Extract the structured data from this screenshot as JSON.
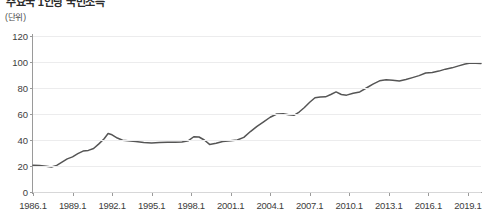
{
  "header": {
    "title": "주요국 1인당 국민소득",
    "bullet_icon": "bullet-dot-icon",
    "unit_label": "(단위)"
  },
  "chart_data": {
    "type": "line",
    "title": "주요국 1인당 국민소득",
    "xlabel": "",
    "ylabel": "(단위)",
    "ylim": [
      0,
      120
    ],
    "xlim": [
      1986.0,
      2020.0
    ],
    "grid": true,
    "legend": "none",
    "y_ticks": [
      0,
      20,
      40,
      60,
      80,
      100,
      120
    ],
    "x_ticks": [
      "1986.1",
      "1989.1",
      "1992.1",
      "1995.1",
      "1998.1",
      "2001.1",
      "2004.1",
      "2007.1",
      "2010.1",
      "2013.1",
      "2016.1",
      "2019.1"
    ],
    "x_tick_values": [
      1986,
      1989,
      1992,
      1995,
      1998,
      2001,
      2004,
      2007,
      2010,
      2013,
      2016,
      2019
    ],
    "series": [
      {
        "name": "series-1",
        "color": "#555555",
        "x": [
          1986.0,
          1986.5,
          1987.0,
          1987.4,
          1987.8,
          1988.2,
          1988.6,
          1989.0,
          1989.4,
          1989.8,
          1990.2,
          1990.6,
          1991.0,
          1991.4,
          1991.7,
          1992.0,
          1992.4,
          1992.8,
          1993.2,
          1993.8,
          1994.4,
          1995.0,
          1995.6,
          1996.2,
          1996.8,
          1997.3,
          1997.8,
          1998.2,
          1998.6,
          1999.0,
          1999.4,
          1999.9,
          2000.4,
          2001.0,
          2001.5,
          2002.0,
          2002.5,
          2003.0,
          2003.5,
          2004.0,
          2004.5,
          2005.0,
          2005.4,
          2005.8,
          2006.2,
          2006.6,
          2007.0,
          2007.4,
          2007.8,
          2008.2,
          2008.6,
          2009.0,
          2009.4,
          2009.8,
          2010.3,
          2010.8,
          2011.3,
          2011.8,
          2012.3,
          2012.8,
          2013.3,
          2013.8,
          2014.3,
          2014.8,
          2015.3,
          2015.8,
          2016.3,
          2016.8,
          2017.3,
          2017.8,
          2018.3,
          2018.8,
          2019.2,
          2019.6,
          2020.0
        ],
        "y": [
          20.5,
          20.3,
          19.8,
          19.2,
          20.5,
          23.0,
          25.5,
          27.0,
          29.5,
          31.5,
          32.0,
          33.5,
          37.0,
          41.0,
          45.0,
          44.0,
          41.5,
          39.8,
          39.5,
          38.8,
          38.0,
          37.6,
          38.0,
          38.2,
          38.3,
          38.5,
          39.5,
          42.5,
          42.3,
          40.0,
          36.6,
          37.5,
          38.8,
          39.5,
          40.0,
          42.0,
          46.5,
          50.5,
          54.0,
          57.5,
          60.0,
          60.2,
          59.5,
          59.0,
          61.5,
          65.0,
          69.0,
          72.5,
          73.0,
          73.2,
          75.0,
          77.0,
          75.0,
          74.5,
          76.0,
          77.0,
          80.0,
          83.0,
          85.5,
          86.3,
          86.0,
          85.4,
          86.5,
          88.0,
          89.5,
          91.5,
          92.0,
          93.0,
          94.5,
          95.5,
          97.0,
          98.5,
          99.2,
          99.0,
          98.8
        ]
      }
    ]
  }
}
